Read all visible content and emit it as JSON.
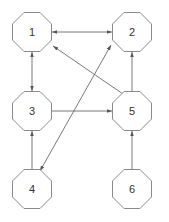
{
  "diagram": {
    "type": "directed-graph",
    "colors": {
      "node_stroke": "#8a8a8a",
      "edge": "#6a6a6a",
      "label": "#333333",
      "background": "#ffffff"
    },
    "nodes": [
      {
        "id": "1",
        "label": "1",
        "cx": 32,
        "cy": 32
      },
      {
        "id": "2",
        "label": "2",
        "cx": 132,
        "cy": 32
      },
      {
        "id": "3",
        "label": "3",
        "cx": 32,
        "cy": 111
      },
      {
        "id": "5",
        "label": "5",
        "cx": 132,
        "cy": 111
      },
      {
        "id": "4",
        "label": "4",
        "cx": 32,
        "cy": 189
      },
      {
        "id": "6",
        "label": "6",
        "cx": 132,
        "cy": 189
      }
    ],
    "edges": [
      {
        "from": "1",
        "to": "2",
        "bidirectional": true
      },
      {
        "from": "1",
        "to": "3",
        "bidirectional": true
      },
      {
        "from": "3",
        "to": "5",
        "bidirectional": false
      },
      {
        "from": "5",
        "to": "2",
        "bidirectional": false
      },
      {
        "from": "5",
        "to": "1",
        "bidirectional": false
      },
      {
        "from": "4",
        "to": "3",
        "bidirectional": false
      },
      {
        "from": "6",
        "to": "5",
        "bidirectional": false
      },
      {
        "from": "4",
        "to": "2",
        "bidirectional": true
      }
    ]
  }
}
